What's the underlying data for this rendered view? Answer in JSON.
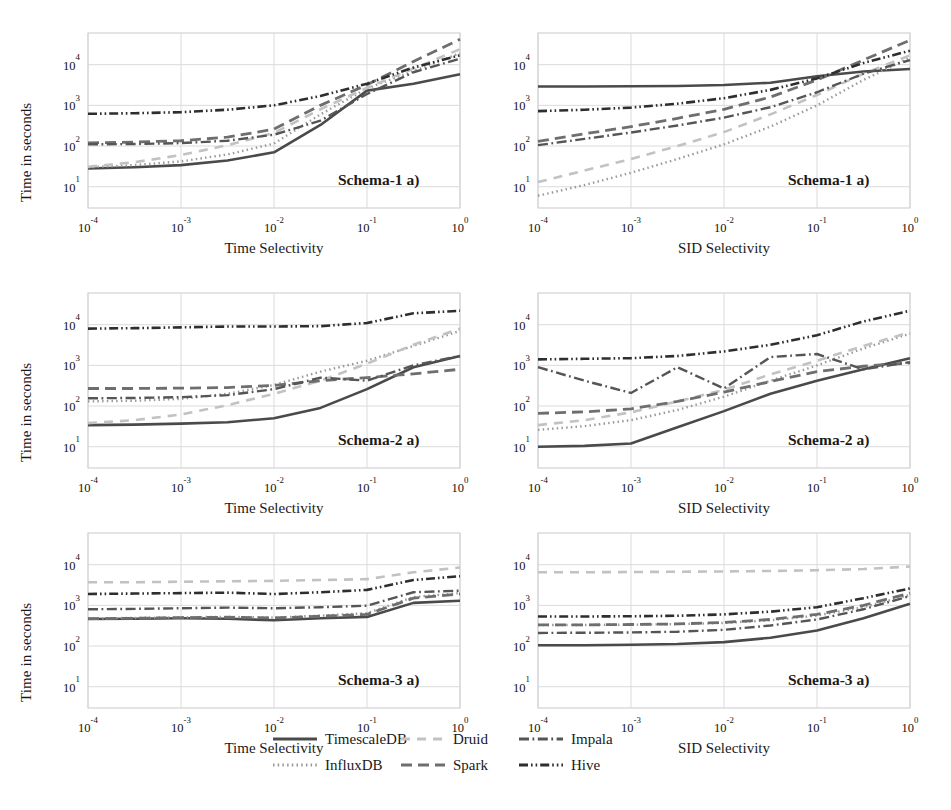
{
  "figure": {
    "width": 951,
    "height": 810,
    "background": "#ffffff"
  },
  "axes": {
    "ylabel": "Time in seconds",
    "xlabel_time": "Time Selectivity",
    "xlabel_sid": "SID Selectivity",
    "xticks": [
      "10-4",
      "10-3",
      "10-2",
      "10-1",
      "100"
    ],
    "xtick_mantissa": "10",
    "xtick_exponents": [
      "-4",
      "-3",
      "-2",
      "-1",
      "0"
    ],
    "ytick_exponents": [
      "4",
      "3",
      "2",
      "1"
    ],
    "xlim": [
      0.0001,
      1
    ],
    "ylim": [
      3,
      60000
    ],
    "xscale": "log",
    "yscale": "log",
    "grid": true,
    "grid_color": "#d7d7d7"
  },
  "series_styles": [
    {
      "key": "timescaledb",
      "label": "TimescaleDB",
      "color": "#4a4a4a",
      "width": 2.6,
      "dash": "none"
    },
    {
      "key": "influxdb",
      "label": "InfluxDB",
      "color": "#9a9a9a",
      "width": 2.4,
      "dash": "1.5,3.2"
    },
    {
      "key": "druid",
      "label": "Druid",
      "color": "#c2c2c2",
      "width": 2.6,
      "dash": "9,7"
    },
    {
      "key": "spark",
      "label": "Spark",
      "color": "#6e6e6e",
      "width": 2.8,
      "dash": "11,6"
    },
    {
      "key": "impala",
      "label": "Impala",
      "color": "#555555",
      "width": 2.4,
      "dash": "10,3.5,1.8,3.5"
    },
    {
      "key": "hive",
      "label": "Hive",
      "color": "#2e2e2e",
      "width": 2.6,
      "dash": "9,3,1.6,3,1.6,3"
    }
  ],
  "legend": {
    "columns": 3,
    "rows": 2,
    "entries": [
      {
        "label": "TimescaleDB",
        "style": "timescaledb"
      },
      {
        "label": "Druid",
        "style": "druid"
      },
      {
        "label": "Impala",
        "style": "impala"
      },
      {
        "label": "InfluxDB",
        "style": "influxdb"
      },
      {
        "label": "Spark",
        "style": "spark"
      },
      {
        "label": "Hive",
        "style": "hive"
      }
    ]
  },
  "chart_data": [
    {
      "type": "line",
      "panel_id": "schema1-time",
      "tag": "Schema-1 a)",
      "xlabel": "Time Selectivity",
      "ylabel": "Time in seconds",
      "xscale": "log",
      "yscale": "log",
      "xlim": [
        0.0001,
        1
      ],
      "ylim": [
        3,
        60000
      ],
      "grid": true,
      "x": [
        0.0001,
        0.000316,
        0.001,
        0.00316,
        0.01,
        0.0316,
        0.1,
        0.316,
        1
      ],
      "series": [
        {
          "name": "TimescaleDB",
          "values": [
            28,
            30,
            34,
            44,
            70,
            330,
            2300,
            3400,
            5800
          ]
        },
        {
          "name": "InfluxDB",
          "values": [
            30,
            34,
            42,
            62,
            115,
            600,
            2600,
            7000,
            19000
          ]
        },
        {
          "name": "Druid",
          "values": [
            31,
            40,
            60,
            105,
            210,
            800,
            2700,
            8000,
            24000
          ]
        },
        {
          "name": "Spark",
          "values": [
            120,
            125,
            135,
            165,
            260,
            1000,
            3200,
            12000,
            42000
          ]
        },
        {
          "name": "Impala",
          "values": [
            110,
            112,
            118,
            135,
            190,
            420,
            1900,
            6500,
            14000
          ]
        },
        {
          "name": "Hive",
          "values": [
            620,
            640,
            680,
            780,
            1000,
            1700,
            3400,
            8500,
            17000
          ]
        }
      ]
    },
    {
      "type": "line",
      "panel_id": "schema1-sid",
      "tag": "Schema-1 a)",
      "xlabel": "SID Selectivity",
      "ylabel": "Time in seconds",
      "xscale": "log",
      "yscale": "log",
      "xlim": [
        0.0001,
        1
      ],
      "ylim": [
        3,
        60000
      ],
      "grid": true,
      "x": [
        0.0001,
        0.000316,
        0.001,
        0.00316,
        0.01,
        0.0316,
        0.1,
        0.316,
        1
      ],
      "series": [
        {
          "name": "TimescaleDB",
          "values": [
            2900,
            2900,
            2950,
            3000,
            3150,
            3600,
            5200,
            6800,
            7800
          ]
        },
        {
          "name": "InfluxDB",
          "values": [
            6,
            11,
            22,
            48,
            110,
            300,
            1000,
            4200,
            15000
          ]
        },
        {
          "name": "Druid",
          "values": [
            13,
            25,
            48,
            100,
            220,
            600,
            1800,
            6000,
            17000
          ]
        },
        {
          "name": "Spark",
          "values": [
            130,
            200,
            300,
            480,
            800,
            1600,
            4200,
            13000,
            40000
          ]
        },
        {
          "name": "Impala",
          "values": [
            105,
            150,
            215,
            320,
            500,
            900,
            2100,
            6000,
            13000
          ]
        },
        {
          "name": "Hive",
          "values": [
            720,
            780,
            880,
            1100,
            1500,
            2400,
            4600,
            11000,
            22000
          ]
        }
      ]
    },
    {
      "type": "line",
      "panel_id": "schema2-time",
      "tag": "Schema-2 a)",
      "xlabel": "Time Selectivity",
      "ylabel": "Time in seconds",
      "xscale": "log",
      "yscale": "log",
      "xlim": [
        0.0001,
        1
      ],
      "ylim": [
        3,
        60000
      ],
      "grid": true,
      "x": [
        0.0001,
        0.000316,
        0.001,
        0.00316,
        0.01,
        0.0316,
        0.1,
        0.316,
        1
      ],
      "series": [
        {
          "name": "TimescaleDB",
          "values": [
            34,
            35,
            37,
            40,
            50,
            90,
            260,
            900,
            1700
          ]
        },
        {
          "name": "InfluxDB",
          "values": [
            130,
            135,
            150,
            200,
            330,
            700,
            1300,
            3000,
            7000
          ]
        },
        {
          "name": "Druid",
          "values": [
            38,
            45,
            62,
            105,
            200,
            420,
            1100,
            3200,
            8000
          ]
        },
        {
          "name": "Spark",
          "values": [
            270,
            270,
            275,
            285,
            320,
            420,
            500,
            620,
            800
          ]
        },
        {
          "name": "Impala",
          "values": [
            155,
            158,
            165,
            185,
            260,
            500,
            420,
            1000,
            1700
          ]
        },
        {
          "name": "Hive",
          "values": [
            8000,
            8200,
            8600,
            9000,
            9000,
            9200,
            11000,
            19000,
            22000
          ]
        }
      ]
    },
    {
      "type": "line",
      "panel_id": "schema2-sid",
      "tag": "Schema-2 a)",
      "xlabel": "SID Selectivity",
      "ylabel": "Time in seconds",
      "xscale": "log",
      "yscale": "log",
      "xlim": [
        0.0001,
        1
      ],
      "ylim": [
        3,
        60000
      ],
      "grid": true,
      "x": [
        0.0001,
        0.000316,
        0.001,
        0.00316,
        0.01,
        0.0316,
        0.1,
        0.316,
        1
      ],
      "series": [
        {
          "name": "TimescaleDB",
          "values": [
            10,
            10.5,
            12,
            30,
            75,
            200,
            420,
            800,
            1500
          ]
        },
        {
          "name": "InfluxDB",
          "values": [
            26,
            32,
            45,
            80,
            170,
            420,
            1000,
            2600,
            6000
          ]
        },
        {
          "name": "Druid",
          "values": [
            34,
            45,
            70,
            130,
            250,
            600,
            1300,
            3000,
            6500
          ]
        },
        {
          "name": "Spark",
          "values": [
            66,
            72,
            85,
            130,
            220,
            400,
            700,
            950,
            1150
          ]
        },
        {
          "name": "Impala",
          "values": [
            900,
            420,
            210,
            900,
            270,
            1600,
            1900,
            800,
            1200
          ]
        },
        {
          "name": "Hive",
          "values": [
            1400,
            1450,
            1500,
            1700,
            2200,
            3200,
            5500,
            12000,
            22000
          ]
        }
      ]
    },
    {
      "type": "line",
      "panel_id": "schema3-time",
      "tag": "Schema-3 a)",
      "xlabel": "Time Selectivity",
      "ylabel": "Time in seconds",
      "xscale": "log",
      "yscale": "log",
      "xlim": [
        0.0001,
        1
      ],
      "ylim": [
        3,
        60000
      ],
      "grid": true,
      "x": [
        0.0001,
        0.000316,
        0.001,
        0.00316,
        0.01,
        0.0316,
        0.1,
        0.316,
        1
      ],
      "series": [
        {
          "name": "TimescaleDB",
          "values": [
            460,
            470,
            480,
            470,
            430,
            480,
            520,
            1150,
            1300
          ]
        },
        {
          "name": "InfluxDB",
          "values": [
            480,
            490,
            510,
            520,
            500,
            560,
            640,
            1600,
            2000
          ]
        },
        {
          "name": "Druid",
          "values": [
            3700,
            3700,
            3800,
            3900,
            4000,
            4200,
            4400,
            6500,
            8500
          ]
        },
        {
          "name": "Spark",
          "values": [
            470,
            480,
            500,
            510,
            490,
            540,
            600,
            1500,
            1900
          ]
        },
        {
          "name": "Impala",
          "values": [
            800,
            820,
            850,
            880,
            850,
            900,
            980,
            2100,
            2300
          ]
        },
        {
          "name": "Hive",
          "values": [
            1900,
            1950,
            2000,
            2050,
            1900,
            2100,
            2400,
            4200,
            5200
          ]
        }
      ]
    },
    {
      "type": "line",
      "panel_id": "schema3-sid",
      "tag": "Schema-3 a)",
      "xlabel": "SID Selectivity",
      "ylabel": "Time in seconds",
      "xscale": "log",
      "yscale": "log",
      "xlim": [
        0.0001,
        1
      ],
      "ylim": [
        3,
        60000
      ],
      "grid": true,
      "x": [
        0.0001,
        0.000316,
        0.001,
        0.00316,
        0.01,
        0.0316,
        0.1,
        0.316,
        1
      ],
      "series": [
        {
          "name": "TimescaleDB",
          "values": [
            105,
            105,
            108,
            112,
            125,
            160,
            240,
            480,
            1100
          ]
        },
        {
          "name": "InfluxDB",
          "values": [
            330,
            330,
            335,
            345,
            370,
            430,
            560,
            900,
            1800
          ]
        },
        {
          "name": "Druid",
          "values": [
            6500,
            6500,
            6600,
            6700,
            6800,
            7000,
            7300,
            7800,
            9000
          ]
        },
        {
          "name": "Spark",
          "values": [
            330,
            332,
            338,
            350,
            380,
            450,
            600,
            1000,
            2000
          ]
        },
        {
          "name": "Impala",
          "values": [
            210,
            212,
            216,
            225,
            250,
            320,
            450,
            800,
            1700
          ]
        },
        {
          "name": "Hive",
          "values": [
            530,
            532,
            540,
            555,
            600,
            700,
            900,
            1500,
            2600
          ]
        }
      ]
    }
  ],
  "panels": [
    {
      "id": "schema1-time",
      "tag": "Schema-1 a)",
      "xlabel": "Time Selectivity",
      "row": 0,
      "col": 0
    },
    {
      "id": "schema1-sid",
      "tag": "Schema-1 a)",
      "xlabel": "SID Selectivity",
      "row": 0,
      "col": 1
    },
    {
      "id": "schema2-time",
      "tag": "Schema-2 a)",
      "xlabel": "Time Selectivity",
      "row": 1,
      "col": 0
    },
    {
      "id": "schema2-sid",
      "tag": "Schema-2 a)",
      "xlabel": "SID Selectivity",
      "row": 1,
      "col": 1
    },
    {
      "id": "schema3-time",
      "tag": "Schema-3 a)",
      "xlabel": "Time Selectivity",
      "row": 2,
      "col": 0
    },
    {
      "id": "schema3-sid",
      "tag": "Schema-3 a)",
      "xlabel": "SID Selectivity",
      "row": 2,
      "col": 1
    }
  ]
}
